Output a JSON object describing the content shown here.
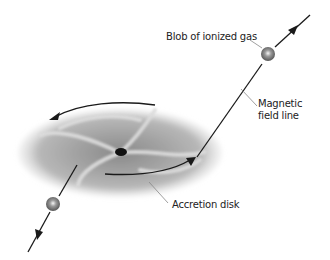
{
  "diagram": {
    "labels": {
      "blob": "Blob of ionized gas",
      "field_line_1": "Magnetic",
      "field_line_2": "field line",
      "disk": "Accretion disk"
    },
    "colors": {
      "disk_light": "#e4e4e4",
      "disk_mid": "#a8a8a8",
      "disk_dark": "#7a7a7a",
      "line": "#222222",
      "leader": "#888888"
    }
  }
}
